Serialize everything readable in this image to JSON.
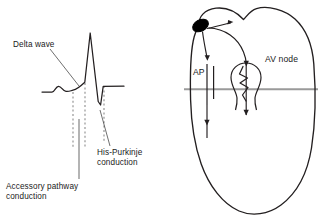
{
  "figure": {
    "colors": {
      "trace": "#231f20",
      "outline": "#231f20",
      "dashed_marker": "#8c8c8c",
      "leader_gray": "#8c8c8c",
      "av_groove": "#9a9a9a",
      "sa_node_fill": "#000000",
      "background": "#ffffff"
    },
    "ecg_panel": {
      "name": "ecg-delta-wave-tracing",
      "labels": {
        "delta_wave": "Delta wave",
        "his_purkinje": "His-Purkinje\nconduction",
        "accessory_pathway": "Accessory pathway\nconduction"
      },
      "baseline_y": 92,
      "dashed_marker_x": [
        73,
        85,
        104
      ],
      "features": [
        {
          "name": "baseline-start",
          "x": 42,
          "y": 92
        },
        {
          "name": "p-wave-peak",
          "x": 58,
          "y": 86
        },
        {
          "name": "delta-wave-slur-onset",
          "x": 73,
          "y": 90
        },
        {
          "name": "qrs-onset",
          "x": 85,
          "y": 82
        },
        {
          "name": "r-wave-peak",
          "x": 90,
          "y": 33
        },
        {
          "name": "s-wave-nadir",
          "x": 101,
          "y": 105
        },
        {
          "name": "j-point",
          "x": 104,
          "y": 86
        },
        {
          "name": "baseline-end",
          "x": 124,
          "y": 86
        }
      ]
    },
    "heart_panel": {
      "name": "heart-conduction-diagram",
      "labels": {
        "accessory_pathway": "AP",
        "av_node": "AV node"
      },
      "structures": [
        {
          "name": "sa-node",
          "shape": "filled-ellipse",
          "x": 199,
          "y": 25
        },
        {
          "name": "atrial-chamber",
          "shape": "bilobed-outline"
        },
        {
          "name": "ventricular-chamber",
          "shape": "rounded-outline"
        },
        {
          "name": "av-groove-line",
          "shape": "horizontal-line",
          "y": 89
        },
        {
          "name": "accessory-pathway-bundle",
          "shape": "double-vertical-line",
          "x": 207
        },
        {
          "name": "av-node-body",
          "shape": "circle-with-zigzag",
          "x": 246,
          "y": 78
        }
      ],
      "conduction_arrows": [
        {
          "name": "arrow-sa-to-atrium-right",
          "direction": "right"
        },
        {
          "name": "arrow-sa-to-accessory-pathway",
          "direction": "down"
        },
        {
          "name": "arrow-sa-to-av-node",
          "direction": "down-right"
        },
        {
          "name": "arrow-accessory-pathway-to-ventricle",
          "direction": "down"
        },
        {
          "name": "arrow-av-node-to-ventricle",
          "direction": "down"
        }
      ]
    }
  }
}
